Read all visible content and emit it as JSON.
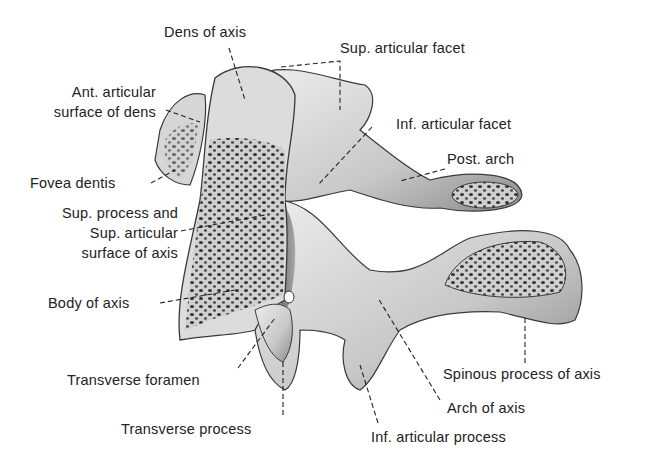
{
  "figure": {
    "labels": {
      "dens_of_axis": "Dens of axis",
      "sup_articular_facet": "Sup. articular facet",
      "ant_articular_surface_1": "Ant. articular",
      "ant_articular_surface_2": "surface of dens",
      "inf_articular_facet": "Inf. articular facet",
      "post_arch": "Post. arch",
      "fovea_dentis": "Fovea dentis",
      "sup_process_1": "Sup. process and",
      "sup_process_2": "Sup. articular",
      "sup_process_3": "surface of axis",
      "body_of_axis": "Body of axis",
      "transverse_foramen": "Transverse foramen",
      "transverse_process": "Transverse process",
      "spinous_process": "Spinous process of axis",
      "arch_of_axis": "Arch of axis",
      "inf_articular_process": "Inf. articular process"
    },
    "colors": {
      "bone_light": "#e2e2e2",
      "bone_mid": "#b5b5b5",
      "bone_dark": "#5a5a5a",
      "outline": "#3a3a3a",
      "text": "#222222"
    }
  }
}
